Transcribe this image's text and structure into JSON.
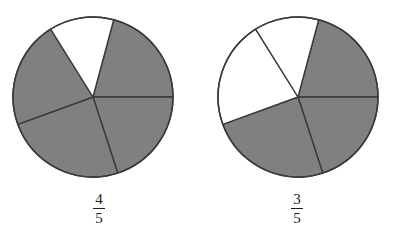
{
  "figure": {
    "background_color": "#ffffff",
    "shaded_color": "#808080",
    "unshaded_color": "#ffffff",
    "outline_color": "#3a3a3a",
    "text_color": "#1a1a1a"
  },
  "chart_data": {
    "type": "pie",
    "title": "",
    "charts": [
      {
        "name": "four-fifths",
        "denominator": 5,
        "numerator": 4,
        "label_numerator": "4",
        "label_denominator": "5",
        "center_x": 92,
        "center_y": 96,
        "radius": 80,
        "sectors": [
          {
            "index": 0,
            "start_angle": -75,
            "end_angle": 0,
            "shaded": true
          },
          {
            "index": 1,
            "start_angle": 0,
            "end_angle": 72,
            "shaded": true
          },
          {
            "index": 2,
            "start_angle": 72,
            "end_angle": 160,
            "shaded": true
          },
          {
            "index": 3,
            "start_angle": 160,
            "end_angle": 238,
            "shaded": true
          },
          {
            "index": 4,
            "start_angle": 238,
            "end_angle": 285,
            "shaded": false
          }
        ]
      },
      {
        "name": "three-fifths",
        "denominator": 5,
        "numerator": 3,
        "label_numerator": "3",
        "label_denominator": "5",
        "center_x": 297,
        "center_y": 96,
        "radius": 80,
        "sectors": [
          {
            "index": 0,
            "start_angle": -75,
            "end_angle": 0,
            "shaded": true
          },
          {
            "index": 1,
            "start_angle": 0,
            "end_angle": 72,
            "shaded": true
          },
          {
            "index": 2,
            "start_angle": 72,
            "end_angle": 160,
            "shaded": true
          },
          {
            "index": 3,
            "start_angle": 160,
            "end_angle": 238,
            "shaded": false
          },
          {
            "index": 4,
            "start_angle": 238,
            "end_angle": 285,
            "shaded": false
          }
        ]
      }
    ]
  },
  "left": {
    "fraction": {
      "numerator": "4",
      "denominator": "5"
    }
  },
  "right": {
    "fraction": {
      "numerator": "3",
      "denominator": "5"
    }
  }
}
